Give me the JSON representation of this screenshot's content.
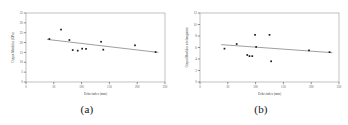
{
  "figure": {
    "panels": [
      {
        "caption": "(a)",
        "caption_name": "panel-a-caption"
      },
      {
        "caption": "(b)",
        "caption_name": "panel-b-caption"
      }
    ]
  },
  "chart_data": [
    {
      "type": "scatter",
      "panel": "(a)",
      "title": "",
      "xlabel": "Echo index (mm)",
      "ylabel": "Output Modulus (GPa)",
      "xlim": [
        0,
        250
      ],
      "ylim": [
        0,
        35
      ],
      "xticks": [
        0,
        50,
        100,
        150,
        200,
        250
      ],
      "yticks": [
        0,
        5,
        10,
        15,
        20,
        25,
        30,
        35
      ],
      "grid": false,
      "legend": "none",
      "points": [
        {
          "x": 42,
          "y": 21.8
        },
        {
          "x": 63,
          "y": 26.6
        },
        {
          "x": 78,
          "y": 21.3
        },
        {
          "x": 84,
          "y": 16.2
        },
        {
          "x": 93,
          "y": 15.9
        },
        {
          "x": 101,
          "y": 16.9
        },
        {
          "x": 108,
          "y": 16.8
        },
        {
          "x": 135,
          "y": 20.4
        },
        {
          "x": 139,
          "y": 16.4
        },
        {
          "x": 196,
          "y": 18.6
        },
        {
          "x": 233,
          "y": 15.2
        }
      ],
      "trendline": {
        "x0": 38,
        "y0": 21.6,
        "x1": 238,
        "y1": 15.0,
        "slope": -0.033
      }
    },
    {
      "type": "scatter",
      "panel": "(b)",
      "title": "",
      "xlabel": "Echo index (mm)",
      "ylabel": "Output Modulus of elongation",
      "xlim": [
        0,
        250
      ],
      "ylim": [
        0,
        12
      ],
      "xticks": [
        0,
        50,
        100,
        150,
        200,
        250
      ],
      "yticks": [
        0,
        2,
        4,
        6,
        8,
        10,
        12
      ],
      "grid": false,
      "legend": "none",
      "points": [
        {
          "x": 44,
          "y": 5.8
        },
        {
          "x": 66,
          "y": 6.6
        },
        {
          "x": 85,
          "y": 4.7
        },
        {
          "x": 89,
          "y": 4.5
        },
        {
          "x": 94,
          "y": 4.5
        },
        {
          "x": 99,
          "y": 8.2
        },
        {
          "x": 101,
          "y": 6.1
        },
        {
          "x": 125,
          "y": 8.2
        },
        {
          "x": 128,
          "y": 3.6
        },
        {
          "x": 196,
          "y": 5.5
        },
        {
          "x": 233,
          "y": 5.2
        }
      ],
      "trendline": {
        "x0": 38,
        "y0": 6.5,
        "x1": 238,
        "y1": 5.1,
        "slope": -0.007
      }
    }
  ]
}
